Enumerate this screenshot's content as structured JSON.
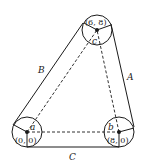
{
  "diagram": {
    "type": "belt-pulley-triangle",
    "pulleys": [
      {
        "id": "a",
        "label": "a",
        "coord": "(0, 0)"
      },
      {
        "id": "b",
        "label": "b",
        "coord": "(8, 0)"
      },
      {
        "id": "c",
        "label": "c",
        "coord": "(6, 8)"
      }
    ],
    "belt_segments": [
      {
        "id": "A",
        "label": "A"
      },
      {
        "id": "B",
        "label": "B"
      },
      {
        "id": "C",
        "label": "C"
      }
    ],
    "colors": {
      "stroke": "#1a1a1a",
      "background": "#ffffff"
    }
  }
}
